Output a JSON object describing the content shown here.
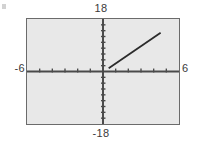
{
  "figure": {
    "name": "graphing-calculator-window",
    "background_color": "#ffffff",
    "plot_background_color": "#e8e8e8",
    "frame_color": "#6b6b6b",
    "axis_color": "#4a4a4a",
    "line_color": "#2b2b2b"
  },
  "labels": {
    "ymax": "18",
    "ymin": "-18",
    "xmin": "-6",
    "xmax": "6"
  },
  "chart_data": {
    "type": "line",
    "title": "",
    "xlabel": "",
    "ylabel": "",
    "xlim": [
      -6,
      6
    ],
    "ylim": [
      -18,
      18
    ],
    "grid": false,
    "legend": "none",
    "xtick_labels": [
      "-6",
      "6"
    ],
    "ytick_labels": [
      "18",
      "-18"
    ],
    "xtick_step": 1,
    "ytick_step": 2,
    "xticks": [
      -5,
      -4,
      -3,
      -2,
      -1,
      1,
      2,
      3,
      4,
      5
    ],
    "yticks": [
      -16,
      -14,
      -12,
      -10,
      -8,
      -6,
      -4,
      -2,
      2,
      4,
      6,
      8,
      10,
      12,
      14,
      16
    ],
    "series": [
      {
        "name": "segment",
        "style": "solid",
        "x": [
          0.45,
          4.55
        ],
        "y": [
          1.1,
          13.3
        ]
      }
    ]
  }
}
